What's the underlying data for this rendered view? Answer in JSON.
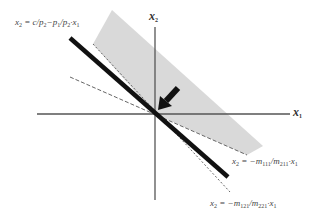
{
  "diagram": {
    "type": "linear-cone-geometry",
    "axes": {
      "x_label_base": "x",
      "x_label_sub": "1",
      "y_label_base": "x",
      "y_label_sub": "2"
    },
    "labels": {
      "budget_line": {
        "lhs": "x",
        "lhs_sub": "2",
        "text": " = c/p",
        "sub1": "2",
        "mid": "−p",
        "sub2": "1",
        "slash": "/p",
        "sub3": "2",
        "tail": "·x",
        "sub4": "1"
      },
      "line_m111": {
        "lhs": "x",
        "lhs_sub": "2",
        "eq": " = −m",
        "num_sub": "111",
        "slash": "/m",
        "den_sub": "211",
        "tail": "·x",
        "tail_sub": "1"
      },
      "line_m121": {
        "lhs": "x",
        "lhs_sub": "2",
        "eq": " = −m",
        "num_sub": "121",
        "slash": "/m",
        "den_sub": "221",
        "tail": "·x",
        "tail_sub": "1"
      }
    },
    "colors": {
      "axis": "#555555",
      "budget_line": "#111111",
      "shaded_region": "#d9d9d9",
      "dashed_lines": "#666666",
      "arrow": "#111111"
    },
    "elements": [
      "x1 axis",
      "x2 axis",
      "thick budget line through origin",
      "grey shaded cone between two dashed rays",
      "dashed line x2 = -m111/m211 · x1",
      "dashed line x2 = -m121/m221 · x1",
      "arrow pointing to origin"
    ]
  }
}
